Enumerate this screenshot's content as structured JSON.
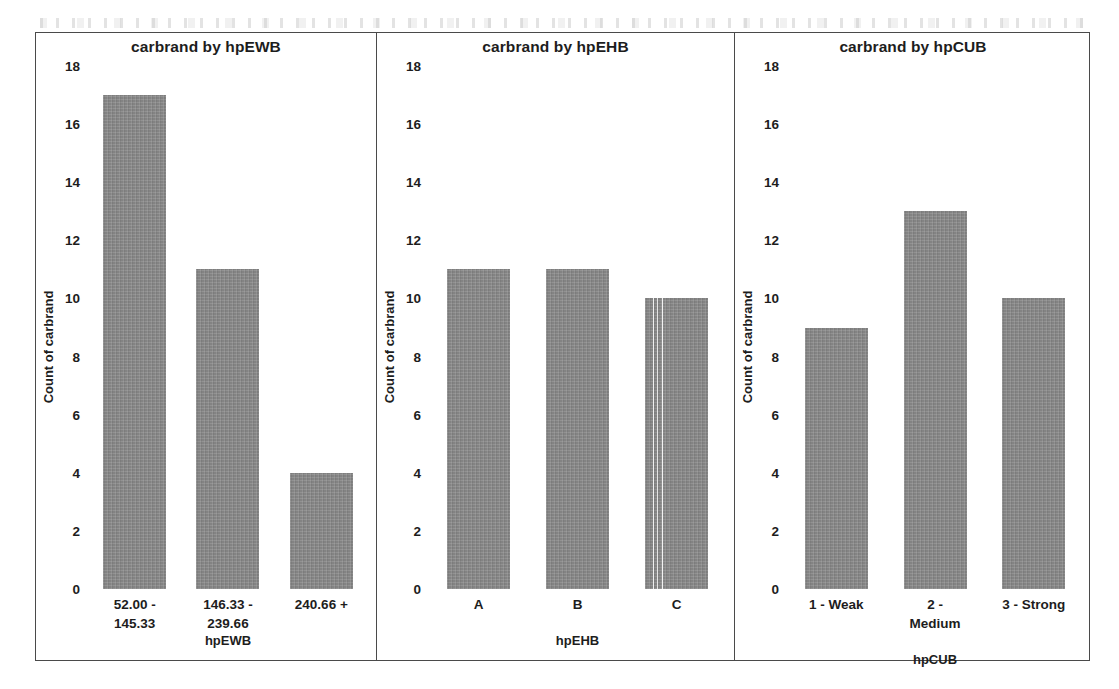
{
  "figure": {
    "bar_color": "#8b8b8b",
    "frame_color": "#4a4a4a",
    "y_ticks": [
      "18",
      "16",
      "14",
      "12",
      "10",
      "8",
      "6",
      "4",
      "2",
      "0"
    ],
    "y_axis_caption": "Count of carbrand"
  },
  "panels": [
    {
      "title": "carbrand by hpEWB",
      "x_caption": "hpEWB",
      "categories": [
        {
          "lines": [
            "52.00 -",
            "145.33"
          ]
        },
        {
          "lines": [
            "146.33 -",
            "239.66"
          ]
        },
        {
          "lines": [
            "240.66 +"
          ]
        }
      ]
    },
    {
      "title": "carbrand by hpEHB",
      "x_caption": "hpEHB",
      "categories": [
        {
          "lines": [
            "A"
          ]
        },
        {
          "lines": [
            "B"
          ]
        },
        {
          "lines": [
            "C"
          ]
        }
      ]
    },
    {
      "title": "carbrand by hpCUB",
      "x_caption": "hpCUB",
      "categories": [
        {
          "lines": [
            "1 - Weak"
          ]
        },
        {
          "lines": [
            "2 -",
            "Medium"
          ]
        },
        {
          "lines": [
            "3 - Strong"
          ]
        }
      ]
    }
  ],
  "chart_data": [
    {
      "type": "bar",
      "title": "carbrand by hpEWB",
      "xlabel": "hpEWB",
      "ylabel": "Count of carbrand",
      "categories": [
        "52.00 - 145.33",
        "146.33 - 239.66",
        "240.66 +"
      ],
      "values": [
        17,
        11,
        4
      ],
      "ylim": [
        0,
        18
      ],
      "yticks": [
        0,
        2,
        4,
        6,
        8,
        10,
        12,
        14,
        16,
        18
      ],
      "grid": false,
      "legend": "none"
    },
    {
      "type": "bar",
      "title": "carbrand by hpEHB",
      "xlabel": "hpEHB",
      "ylabel": "Count of carbrand",
      "categories": [
        "A",
        "B",
        "C"
      ],
      "values": [
        11,
        11,
        10
      ],
      "ylim": [
        0,
        18
      ],
      "yticks": [
        0,
        2,
        4,
        6,
        8,
        10,
        12,
        14,
        16,
        18
      ],
      "grid": false,
      "legend": "none"
    },
    {
      "type": "bar",
      "title": "carbrand by hpCUB",
      "xlabel": "hpCUB",
      "ylabel": "Count of carbrand",
      "categories": [
        "1 - Weak",
        "2 - Medium",
        "3 - Strong"
      ],
      "values": [
        9,
        13,
        10
      ],
      "ylim": [
        0,
        18
      ],
      "yticks": [
        0,
        2,
        4,
        6,
        8,
        10,
        12,
        14,
        16,
        18
      ],
      "grid": false,
      "legend": "none"
    }
  ]
}
